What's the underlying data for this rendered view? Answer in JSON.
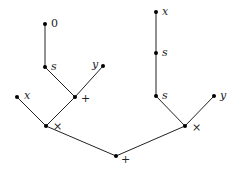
{
  "diagram": {
    "type": "expression-tree",
    "nodes": [
      {
        "id": "n0",
        "label": "0",
        "x": 45,
        "y": 24,
        "lx": 51,
        "ly": 27,
        "italic": false
      },
      {
        "id": "n1",
        "label": "s",
        "x": 45,
        "y": 67,
        "lx": 51,
        "ly": 70,
        "italic": true
      },
      {
        "id": "n2",
        "label": "y",
        "x": 103,
        "y": 66,
        "lx": 92,
        "ly": 68,
        "italic": true
      },
      {
        "id": "n3",
        "label": "+",
        "x": 75,
        "y": 97,
        "lx": 81,
        "ly": 102,
        "italic": false
      },
      {
        "id": "n4",
        "label": "x",
        "x": 17,
        "y": 97,
        "lx": 24,
        "ly": 99,
        "italic": true
      },
      {
        "id": "n5",
        "label": "×",
        "x": 46,
        "y": 126,
        "lx": 53,
        "ly": 130,
        "italic": false
      },
      {
        "id": "n6",
        "label": "+",
        "x": 116,
        "y": 156,
        "lx": 121,
        "ly": 163,
        "italic": false
      },
      {
        "id": "n7",
        "label": "x",
        "x": 156,
        "y": 12,
        "lx": 162,
        "ly": 15,
        "italic": true
      },
      {
        "id": "n8",
        "label": "s",
        "x": 156,
        "y": 53,
        "lx": 162,
        "ly": 56,
        "italic": true
      },
      {
        "id": "n9",
        "label": "s",
        "x": 156,
        "y": 96,
        "lx": 162,
        "ly": 99,
        "italic": true
      },
      {
        "id": "n10",
        "label": "y",
        "x": 214,
        "y": 96,
        "lx": 220,
        "ly": 99,
        "italic": true
      },
      {
        "id": "n11",
        "label": "×",
        "x": 185,
        "y": 126,
        "lx": 192,
        "ly": 131,
        "italic": false
      }
    ],
    "edges": [
      [
        "n0",
        "n1"
      ],
      [
        "n1",
        "n3"
      ],
      [
        "n2",
        "n3"
      ],
      [
        "n3",
        "n5"
      ],
      [
        "n4",
        "n5"
      ],
      [
        "n5",
        "n6"
      ],
      [
        "n7",
        "n8"
      ],
      [
        "n8",
        "n9"
      ],
      [
        "n9",
        "n11"
      ],
      [
        "n10",
        "n11"
      ],
      [
        "n11",
        "n6"
      ]
    ]
  }
}
